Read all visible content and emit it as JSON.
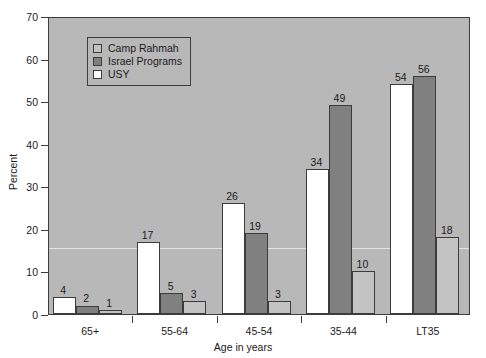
{
  "chart_data": {
    "type": "bar",
    "title": "",
    "xlabel": "Age in years",
    "ylabel": "Percent",
    "ylim": [
      0,
      70
    ],
    "yticks": [
      0,
      10,
      20,
      30,
      40,
      50,
      60,
      70
    ],
    "grid": false,
    "legend_position": "upper-left inside plot",
    "categories": [
      "65+",
      "55-64",
      "45-54",
      "35-44",
      "LT35"
    ],
    "bar_draw_order": [
      "USY",
      "Israel Programs",
      "Camp Rahmah"
    ],
    "series": [
      {
        "name": "Camp Rahmah",
        "color": "#c3c3c3",
        "values": [
          1,
          3,
          3,
          10,
          18
        ]
      },
      {
        "name": "Israel Programs",
        "color": "#808080",
        "values": [
          2,
          5,
          19,
          49,
          56
        ]
      },
      {
        "name": "USY",
        "color": "#ffffff",
        "values": [
          4,
          17,
          26,
          34,
          54
        ]
      }
    ],
    "annotations": {
      "reference_line_value": 16,
      "reference_line_color": "#ebebeb"
    },
    "style": {
      "plot_background": "#b8b8b8",
      "axis_color": "#3c3c3c",
      "text_color": "#1a1a1a",
      "figure_background": "#ffffff"
    }
  },
  "legend": {
    "items": [
      {
        "label": "Camp Rahmah",
        "swatch": "s-camp"
      },
      {
        "label": "Israel Programs",
        "swatch": "s-israel"
      },
      {
        "label": "USY",
        "swatch": "s-usy"
      }
    ]
  },
  "axes": {
    "y_title": "Percent",
    "x_title": "Age in years",
    "y_tick_labels": [
      "0",
      "10",
      "20",
      "30",
      "40",
      "50",
      "60",
      "70"
    ],
    "x_tick_labels": [
      "65+",
      "55-64",
      "45-54",
      "35-44",
      "LT35"
    ]
  }
}
